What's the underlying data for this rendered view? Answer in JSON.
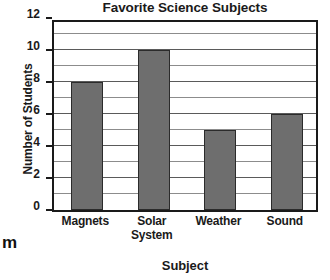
{
  "chart_data": {
    "type": "bar",
    "title": "Favorite Science Subjects",
    "xlabel": "Subject",
    "ylabel": "Number of Students",
    "categories": [
      "Magnets",
      "Solar System",
      "Weather",
      "Sound"
    ],
    "values": [
      8,
      10,
      5,
      6
    ],
    "ylim": [
      0,
      12
    ],
    "ytick_labels": [
      "0",
      "2",
      "4",
      "6",
      "8",
      "10",
      "12"
    ],
    "ytick_values": [
      0,
      2,
      4,
      6,
      8,
      10,
      12
    ],
    "ytick_step": 2,
    "gridline_step": 1,
    "grid": true,
    "legend": false,
    "legend_position": "none",
    "bar_color": "#6e6e6e",
    "bar_edge_color": "#2b2b2b",
    "grid_color": "#8c8c8c",
    "axis_color": "#1a1a1a",
    "background_color": "#ffffff"
  },
  "artifacts": {
    "margin_fragment": "m"
  }
}
